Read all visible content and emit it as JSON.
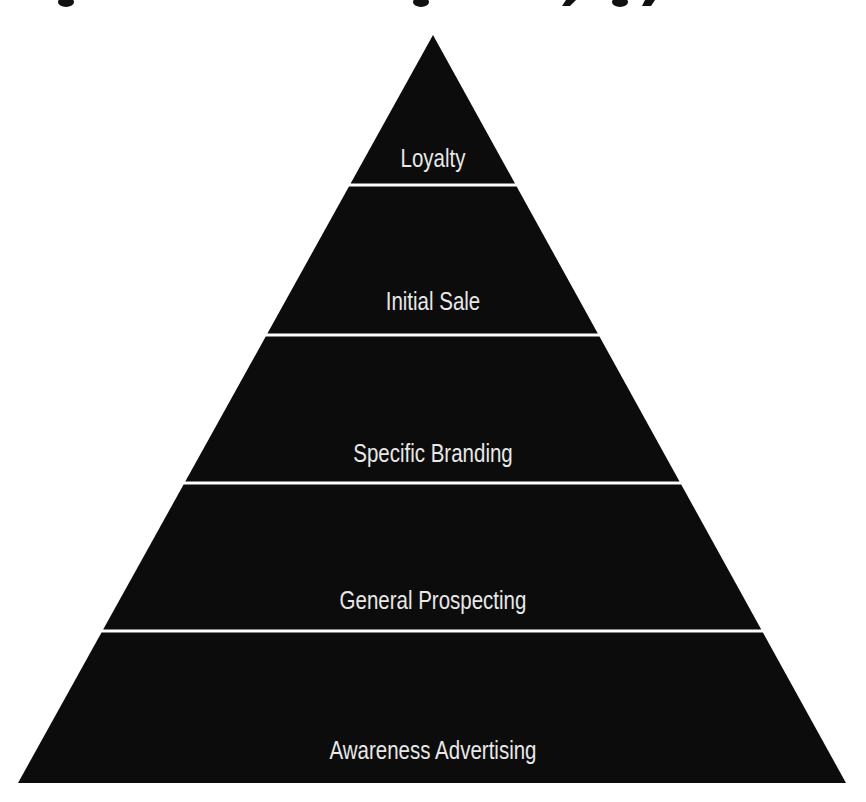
{
  "diagram": {
    "type": "pyramid",
    "title_visible": false,
    "colors": {
      "tier_fill": "#0c0c0c",
      "divider": "#ffffff",
      "label_text": "#e8e8e8",
      "background": "#ffffff"
    },
    "tiers_top_to_bottom": [
      {
        "label": "Loyalty"
      },
      {
        "label": "Initial Sale"
      },
      {
        "label": "Specific Branding"
      },
      {
        "label": "General Prospecting"
      },
      {
        "label": "Awareness Advertising"
      }
    ]
  }
}
